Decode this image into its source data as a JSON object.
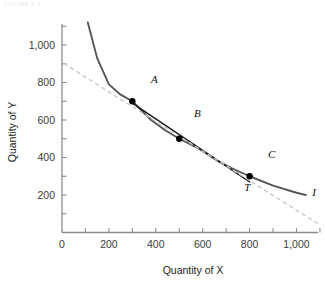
{
  "figure": {
    "caption_fragment": "FIGURE 8.4",
    "background_color": "#ffffff"
  },
  "colors": {
    "curve": "#55565a",
    "tangent": "#1a1a1a",
    "budget_dashed": "#c9c9c9",
    "axis": "#8d8d8d",
    "text": "#231f20",
    "point_fill": "#000000"
  },
  "chart_data": {
    "type": "line",
    "title": "",
    "xlabel": "Quantity of X",
    "ylabel": "Quantity of Y",
    "xlim": [
      0,
      1100
    ],
    "ylim": [
      0,
      1120
    ],
    "grid": false,
    "legend": false,
    "x_ticks": [
      0,
      200,
      400,
      600,
      800,
      1000
    ],
    "x_tick_labels": [
      "0",
      "200",
      "400",
      "600",
      "800",
      "1,000"
    ],
    "x_minor_ticks": [
      100,
      300,
      500,
      700,
      900,
      1100
    ],
    "y_ticks": [
      200,
      400,
      600,
      800,
      1000
    ],
    "y_tick_labels": [
      "200",
      "400",
      "600",
      "800",
      "1,000"
    ],
    "y_minor_ticks": [
      100,
      300,
      500,
      700,
      900,
      1100
    ],
    "series": [
      {
        "name": "I",
        "label": "I",
        "style": "solid",
        "color": "#55565a",
        "description": "indifference curve",
        "points": [
          [
            110,
            1120
          ],
          [
            150,
            930
          ],
          [
            200,
            790
          ],
          [
            250,
            735
          ],
          [
            300,
            700
          ],
          [
            380,
            600
          ],
          [
            440,
            545
          ],
          [
            500,
            500
          ],
          [
            580,
            450
          ],
          [
            660,
            385
          ],
          [
            720,
            345
          ],
          [
            800,
            300
          ],
          [
            900,
            250
          ],
          [
            1000,
            212
          ],
          [
            1040,
            200
          ]
        ],
        "label_point": [
          1075,
          195
        ]
      },
      {
        "name": "T",
        "label": "T",
        "style": "solid",
        "color": "#1a1a1a",
        "description": "tangent line at point B",
        "points": [
          [
            300,
            690
          ],
          [
            800,
            270
          ]
        ],
        "label_point": [
          790,
          222
        ]
      },
      {
        "name": "budget-line",
        "label": "",
        "style": "dashed",
        "color": "#c9c9c9",
        "description": "dashed reference line",
        "points": [
          [
            10,
            900
          ],
          [
            1100,
            40
          ]
        ]
      }
    ],
    "points": [
      {
        "label": "A",
        "x": 300,
        "y": 700,
        "label_dx": 22,
        "label_dy": -18
      },
      {
        "label": "B",
        "x": 500,
        "y": 500,
        "label_dx": 18,
        "label_dy": -22
      },
      {
        "label": "C",
        "x": 800,
        "y": 300,
        "label_dx": 22,
        "label_dy": -18
      }
    ],
    "annotations": [
      {
        "text": "I",
        "x": 1075,
        "y": 195,
        "meaning": "indifference-curve-label"
      },
      {
        "text": "T",
        "x": 790,
        "y": 222,
        "meaning": "tangent-line-label"
      }
    ]
  }
}
